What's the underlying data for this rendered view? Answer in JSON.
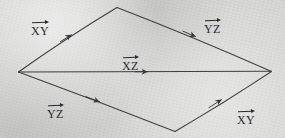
{
  "figure": {
    "kind": "hand-drawn-vector-parallelogram",
    "background_color": "#d6d6d5",
    "ink_color": "#2b2b2b",
    "vertices": {
      "left": {
        "x": 18,
        "y": 72
      },
      "top": {
        "x": 117,
        "y": 7
      },
      "right": {
        "x": 272,
        "y": 72
      },
      "bottom": {
        "x": 175,
        "y": 132
      }
    },
    "edges": [
      {
        "name": "upper-left-edge",
        "from": "left",
        "to": "top",
        "arrow_at": {
          "x": 68,
          "y": 37
        },
        "label": "XY"
      },
      {
        "name": "upper-right-edge",
        "from": "top",
        "to": "right",
        "arrow_at": {
          "x": 192,
          "y": 35
        },
        "label": "YZ"
      },
      {
        "name": "lower-left-edge",
        "from": "left",
        "to": "bottom",
        "arrow_at": {
          "x": 96,
          "y": 100
        },
        "label": "YZ"
      },
      {
        "name": "lower-right-edge",
        "from": "bottom",
        "to": "right",
        "arrow_at": {
          "x": 218,
          "y": 102
        },
        "label": "XY"
      },
      {
        "name": "diagonal-edge",
        "from": "left",
        "to": "right",
        "arrow_at": {
          "x": 145,
          "y": 72
        },
        "label": "XZ"
      }
    ]
  },
  "labels": {
    "top_left": {
      "text": "XY",
      "x": 31,
      "y": 20
    },
    "top_right": {
      "text": "YZ",
      "x": 204,
      "y": 18
    },
    "center": {
      "text": "XZ",
      "x": 122,
      "y": 55
    },
    "bottom_left": {
      "text": "YZ",
      "x": 47,
      "y": 103
    },
    "bottom_right": {
      "text": "XY",
      "x": 237,
      "y": 109
    }
  }
}
